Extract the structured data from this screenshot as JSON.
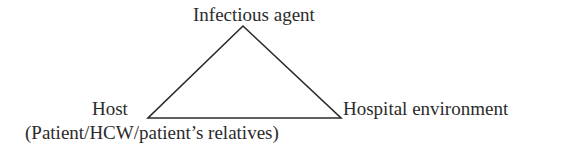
{
  "diagram": {
    "type": "epidemiological-triangle",
    "nodes": {
      "top": {
        "label": "Infectious agent"
      },
      "left": {
        "label": "Host",
        "sublabel": "(Patient/HCW/patient’s relatives)"
      },
      "right": {
        "label": "Hospital environment"
      }
    },
    "edges": [
      {
        "from": "top",
        "to": "left"
      },
      {
        "from": "top",
        "to": "right"
      },
      {
        "from": "left",
        "to": "right"
      }
    ],
    "colors": {
      "line": "#2b2b2b",
      "text": "#2b2b2b",
      "background": "#ffffff"
    }
  }
}
